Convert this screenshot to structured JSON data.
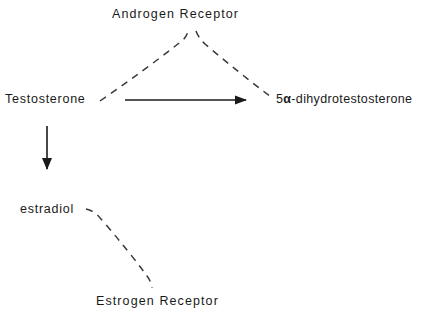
{
  "figure": {
    "type": "pathway-diagram",
    "background_color": "#ffffff",
    "ink_color": "#1a1a1a",
    "width": 440,
    "height": 316
  },
  "nodes": {
    "androgen_receptor": {
      "label": "Androgen Receptor",
      "role": "receptor",
      "x": 190,
      "y": 14
    },
    "testosterone": {
      "label": "Testosterone",
      "role": "hormone",
      "x": 51,
      "y": 99
    },
    "dht": {
      "label_prefix": "5",
      "label_alpha": "α",
      "label_suffix": "-dihydrotestosterone",
      "label": "5α-dihydrotestosterone",
      "role": "hormone",
      "x": 355,
      "y": 99
    },
    "estradiol": {
      "label": "estradiol",
      "role": "hormone",
      "x": 52,
      "y": 209
    },
    "estrogen_receptor": {
      "label": "Estrogen Receptor",
      "role": "receptor",
      "x": 167,
      "y": 301
    }
  },
  "edges": [
    {
      "name": "testosterone-to-dht",
      "from": "testosterone",
      "to": "dht",
      "style": "solid",
      "arrowhead": true,
      "color": "#1a1a1a"
    },
    {
      "name": "testosterone-to-estradiol",
      "from": "testosterone",
      "to": "estradiol",
      "style": "solid",
      "arrowhead": true,
      "color": "#1a1a1a"
    },
    {
      "name": "testosterone-to-androgen-receptor",
      "from": "testosterone",
      "to": "androgen_receptor",
      "style": "dashed",
      "arrowhead": false,
      "color": "#3a3a3a"
    },
    {
      "name": "dht-to-androgen-receptor",
      "from": "dht",
      "to": "androgen_receptor",
      "style": "dashed",
      "arrowhead": false,
      "color": "#3a3a3a"
    },
    {
      "name": "estradiol-to-estrogen-receptor",
      "from": "estradiol",
      "to": "estrogen_receptor",
      "style": "dashed",
      "arrowhead": false,
      "color": "#3a3a3a"
    }
  ]
}
